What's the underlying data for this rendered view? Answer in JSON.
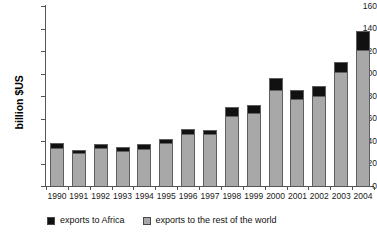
{
  "chart_data": {
    "type": "bar",
    "title": "",
    "subtitle": "",
    "xlabel": "",
    "ylabel": "billion $US",
    "ylim": [
      0,
      160
    ],
    "yticks": [
      0,
      20,
      40,
      60,
      80,
      100,
      120,
      140,
      160
    ],
    "grid": false,
    "stacked": true,
    "legend_position": "bottom-left",
    "categories": [
      "1990",
      "1991",
      "1992",
      "1993",
      "1994",
      "1995",
      "1996",
      "1997",
      "1998",
      "1999",
      "2000",
      "2001",
      "2002",
      "2003",
      "2004"
    ],
    "series": [
      {
        "name": "exports to the rest of the world",
        "color": "#a8a8a8",
        "values": [
          34,
          29,
          34,
          31,
          33,
          38,
          46,
          46,
          62,
          65,
          85,
          77,
          80,
          101,
          121
        ]
      },
      {
        "name": "exports to Africa",
        "color": "#111111",
        "values": [
          4,
          3,
          3,
          4,
          4,
          4,
          5,
          4,
          8,
          7,
          11,
          8,
          9,
          9,
          17
        ]
      }
    ],
    "totals": [
      38,
      32,
      37,
      35,
      37,
      42,
      51,
      50,
      70,
      72,
      96,
      85,
      89,
      110,
      138
    ]
  },
  "legend": {
    "items": [
      {
        "label": "exports to Africa",
        "color": "#111111"
      },
      {
        "label": "exports to the rest of the world",
        "color": "#a8a8a8"
      }
    ]
  }
}
